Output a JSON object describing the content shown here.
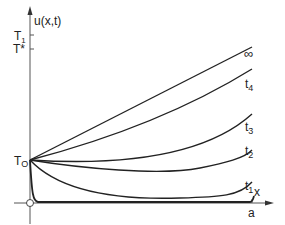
{
  "figure": {
    "y_axis_label": "u(x,t)",
    "x_axis_label": "x",
    "x_end_label": "a",
    "y_ticks": {
      "T1": "T",
      "T1_sub": "1",
      "Tstar": "T*",
      "T0": "T",
      "T0_sub": "O"
    },
    "curves": [
      {
        "name": "t1",
        "label": "t",
        "sub": "1"
      },
      {
        "name": "t2",
        "label": "t",
        "sub": "2"
      },
      {
        "name": "t3",
        "label": "t",
        "sub": "3"
      },
      {
        "name": "t4",
        "label": "t",
        "sub": "4"
      },
      {
        "name": "infinity",
        "label": "∞"
      }
    ],
    "colors": {
      "line": "#222222",
      "axis": "#444444",
      "background": "#ffffff"
    }
  }
}
